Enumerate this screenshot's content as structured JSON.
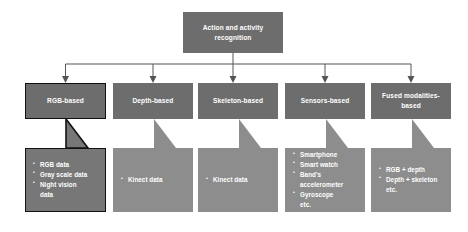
{
  "diagram": {
    "root": {
      "label": "Action and activity recognition"
    },
    "colors": {
      "header_fill": "#6d6d6d",
      "callout_fill": "#8d8d8d",
      "selected_callout_fill": "#777777",
      "selected_border": "#121212",
      "connector": "#555555",
      "text": "#ffffff",
      "background": "#ffffff"
    },
    "branches": [
      {
        "label": "RGB-based",
        "selected": true,
        "items": [
          "RGB data",
          "Gray scale data",
          "Night vision",
          "data"
        ]
      },
      {
        "label": "Depth-based",
        "selected": false,
        "items": [
          "Kinect data"
        ]
      },
      {
        "label": "Skeleton-based",
        "selected": false,
        "items": [
          "Kinect data"
        ]
      },
      {
        "label": "Sensors-based",
        "selected": false,
        "items": [
          "Smartphone",
          "Smart watch",
          "Band's",
          "accelerometer",
          "Gyroscope",
          "etc."
        ]
      },
      {
        "label": "Fused modalities-based",
        "selected": false,
        "items": [
          "RGB + depth",
          "Depth + skeleton",
          "etc."
        ]
      }
    ]
  }
}
